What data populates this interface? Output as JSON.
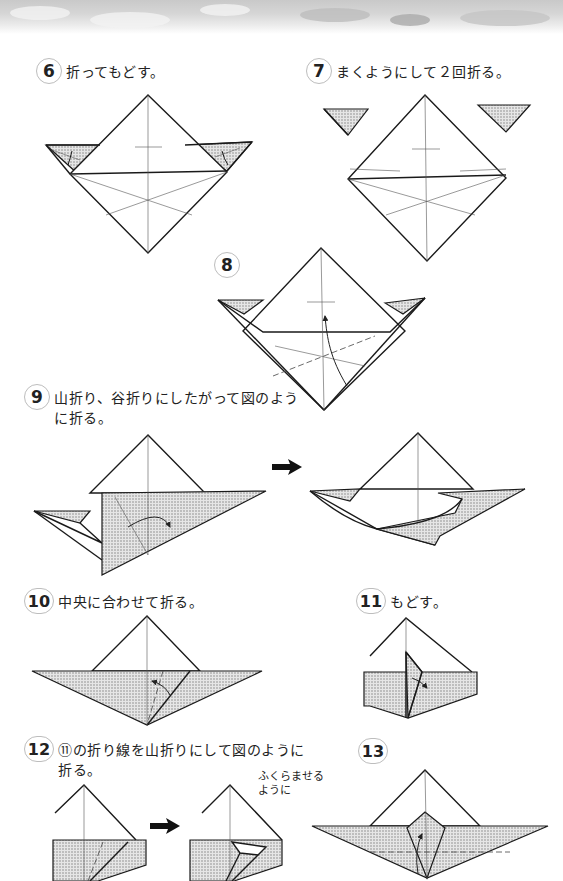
{
  "page": {
    "type": "origami-instructions",
    "header": "cloud-banner"
  },
  "steps": [
    {
      "number": "6",
      "text": "折ってもどす。",
      "ruby": [
        "お"
      ]
    },
    {
      "number": "7",
      "text": "まくようにして２回折る。",
      "ruby": [
        "かい",
        "お"
      ]
    },
    {
      "number": "8",
      "text": ""
    },
    {
      "number": "9",
      "text_line1": "山折り、谷折りにしたがって図のよう",
      "text_line2": "に折る。",
      "ruby": [
        "やま",
        "お",
        "たに",
        "お",
        "ず",
        "お"
      ]
    },
    {
      "number": "10",
      "text": "中央に合わせて折る。",
      "ruby": [
        "ちゅうおう",
        "あ",
        "お"
      ]
    },
    {
      "number": "11",
      "text": "もどす。"
    },
    {
      "number": "12",
      "text_line1": "⑪の折り線を山折りにして図のように",
      "text_line2": "折る。",
      "ruby": [
        "お",
        "せん",
        "やま",
        "お",
        "ず",
        "お"
      ],
      "note_line1": "ふくらませる",
      "note_line2": "ように"
    },
    {
      "number": "13",
      "text": ""
    }
  ],
  "arrows": [
    {
      "from": "step-9a",
      "to": "step-9b",
      "icon": "bold-right-arrow"
    },
    {
      "from": "step-12a",
      "to": "step-12b",
      "icon": "bold-right-arrow"
    }
  ],
  "colors": {
    "line": "#1a1a1a",
    "shade": "#d9d9d9",
    "circle_border": "#bdbdbd",
    "header_gray": "#c9c9c9"
  }
}
